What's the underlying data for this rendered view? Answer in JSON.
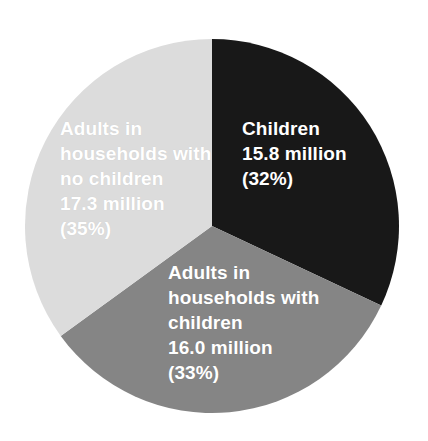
{
  "chart_data": {
    "type": "pie",
    "title": "",
    "subtitle": "",
    "xlabel": "",
    "ylabel": "",
    "legend_position": "none",
    "labels_inside_slices": true,
    "unit": "million",
    "categories": [
      "Children",
      "Adults in households with children",
      "Adults in households with no children"
    ],
    "values": [
      15.8,
      16.0,
      17.3
    ],
    "percentages": [
      32,
      33,
      35
    ],
    "colors": [
      "#181818",
      "#858585",
      "#dcdcdc"
    ],
    "slices": [
      {
        "name": "Children",
        "label_lines": [
          "Children",
          "15.8 million",
          "(32%)"
        ],
        "value": 15.8,
        "value_text": "15.8 million",
        "percent": 32,
        "percent_text": "(32%)",
        "color": "#181818",
        "text_color": "#ffffff",
        "start_angle_deg": 0,
        "end_angle_deg": 115.2
      },
      {
        "name": "Adults in households with children",
        "label_lines": [
          "Adults in",
          "households with",
          "children",
          "16.0 million",
          "(33%)"
        ],
        "value": 16.0,
        "value_text": "16.0 million",
        "percent": 33,
        "percent_text": "(33%)",
        "color": "#858585",
        "text_color": "#ffffff",
        "start_angle_deg": 115.2,
        "end_angle_deg": 234.0
      },
      {
        "name": "Adults in households with no children",
        "label_lines": [
          "Adults in",
          "households with",
          "no children",
          "17.3 million",
          "(35%)"
        ],
        "value": 17.3,
        "value_text": "17.3 million",
        "percent": 35,
        "percent_text": "(35%)",
        "color": "#dcdcdc",
        "text_color": "#ffffff",
        "start_angle_deg": 234.0,
        "end_angle_deg": 360.0
      }
    ],
    "background_color": "#ffffff",
    "geometry": {
      "center_x": 212,
      "center_y": 226,
      "radius": 187
    }
  },
  "labels": {
    "children": "Children\n15.8 million\n(32%)",
    "adults_with_children": "Adults in\nhouseholds with\nchildren\n16.0 million\n(33%)",
    "adults_no_children": "Adults in\nhouseholds with\nno children\n17.3 million\n(35%)"
  }
}
